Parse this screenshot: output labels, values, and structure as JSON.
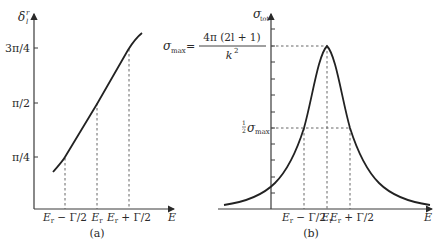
{
  "figure": {
    "panel_a": {
      "caption": "(a)",
      "y_axis_label": "δ",
      "y_axis_sub": "l",
      "y_axis_sup": "r",
      "x_axis_label": "E",
      "y_ticks": [
        "3π/4",
        "π/2",
        "π/4"
      ],
      "x_ticks": [
        {
          "main": "E",
          "sub": "r",
          "rest": " − Γ/2"
        },
        {
          "main": "E",
          "sub": "r",
          "rest": ""
        },
        {
          "main": "E",
          "sub": "r",
          "rest": " + Γ/2"
        }
      ]
    },
    "panel_b": {
      "caption": "(b)",
      "y_axis_label": "σ",
      "y_axis_sub": "tot",
      "x_axis_label": "E",
      "sigma_max_lhs": "σ",
      "sigma_max_sub": "max",
      "equals": "=",
      "sigma_max_numerator": "4π (2l + 1)",
      "sigma_max_denominator": "k",
      "sigma_max_denominator_sup": "2",
      "half_frac_num": "1",
      "half_frac_den": "2",
      "half_sigma": "σ",
      "half_sigma_sub": "max",
      "x_ticks": [
        {
          "main": "E",
          "sub": "r",
          "rest": " − Γ/2"
        },
        {
          "main": "E",
          "sub": "r",
          "rest": ""
        },
        {
          "main": "E",
          "sub": "r",
          "rest": " + Γ/2"
        }
      ]
    }
  }
}
